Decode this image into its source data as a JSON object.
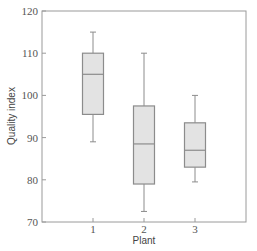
{
  "chart_data": {
    "type": "box",
    "title": "",
    "xlabel": "Plant",
    "ylabel": "Quality index",
    "categories": [
      "1",
      "2",
      "3"
    ],
    "ylim": [
      70,
      120
    ],
    "yticks": [
      70,
      80,
      90,
      100,
      110,
      120
    ],
    "grid": false,
    "legend": null,
    "series": [
      {
        "name": "1",
        "whisker_low": 89,
        "q1": 95.5,
        "median": 105,
        "q3": 110,
        "whisker_high": 115
      },
      {
        "name": "2",
        "whisker_low": 72.5,
        "q1": 79,
        "median": 88.5,
        "q3": 97.5,
        "whisker_high": 110
      },
      {
        "name": "3",
        "whisker_low": 79.5,
        "q1": 83,
        "median": 87,
        "q3": 93.5,
        "whisker_high": 100
      }
    ],
    "colors": {
      "box_fill": "#e3e3e3",
      "box_stroke": "#8c8c8c",
      "whisker": "#8c8c8c",
      "frame": "#9a9a9a"
    }
  }
}
